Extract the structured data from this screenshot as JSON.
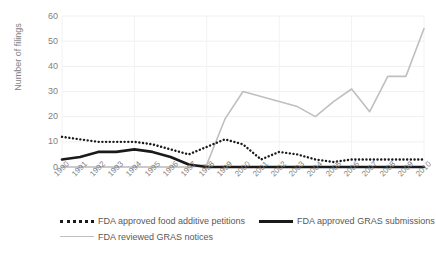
{
  "top_artifact": "      ",
  "axes": {
    "ylabel": "Number of filings",
    "yticks": [
      "0",
      "10",
      "20",
      "30",
      "40",
      "50",
      "60"
    ],
    "xticks": [
      "1990",
      "1991",
      "1992",
      "1993",
      "1994",
      "1995",
      "1996",
      "1997",
      "1998",
      "1999",
      "2000",
      "2001",
      "2002",
      "2003",
      "2004",
      "2005",
      "2006",
      "2007",
      "2008",
      "2009",
      "2010"
    ]
  },
  "legend": {
    "items": [
      {
        "label": "FDA approved food additive petitions",
        "style": "dotted",
        "color": "#1a1a1a"
      },
      {
        "label": "FDA approved GRAS submissions",
        "style": "solid",
        "color": "#1a1a1a"
      },
      {
        "label": "FDA reviewed GRAS notices",
        "style": "thin",
        "color": "#bfbfbf"
      }
    ]
  },
  "chart_data": {
    "type": "line",
    "title": "",
    "xlabel": "",
    "ylabel": "Number of filings",
    "ylim": [
      0,
      60
    ],
    "yticks": [
      0,
      10,
      20,
      30,
      40,
      50,
      60
    ],
    "grid": true,
    "legend_position": "bottom",
    "x": [
      1990,
      1991,
      1992,
      1993,
      1994,
      1995,
      1996,
      1997,
      1998,
      1999,
      2000,
      2001,
      2002,
      2003,
      2004,
      2005,
      2006,
      2007,
      2008,
      2009,
      2010
    ],
    "series": [
      {
        "name": "FDA approved food additive petitions",
        "style": "dotted",
        "color": "#1a1a1a",
        "values": [
          12,
          11,
          10,
          10,
          10,
          9,
          7,
          5,
          8,
          11,
          9,
          3,
          6,
          5,
          3,
          2,
          3,
          3,
          3,
          3,
          3
        ]
      },
      {
        "name": "FDA approved GRAS submissions",
        "style": "solid",
        "color": "#1a1a1a",
        "values": [
          3,
          4,
          6,
          6,
          7,
          6,
          4,
          1,
          0,
          0,
          0,
          0,
          0,
          0,
          0,
          0,
          0,
          0,
          0,
          0,
          0
        ]
      },
      {
        "name": "FDA reviewed GRAS notices",
        "style": "thin",
        "color": "#bfbfbf",
        "values": [
          0,
          0,
          0,
          0,
          0,
          0,
          0,
          0,
          1,
          19,
          30,
          28,
          26,
          24,
          20,
          26,
          31,
          22,
          36,
          36,
          55
        ]
      }
    ]
  }
}
